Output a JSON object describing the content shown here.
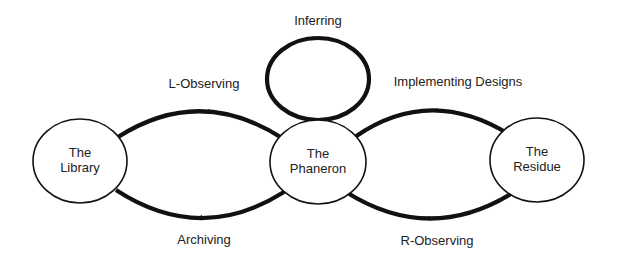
{
  "diagram": {
    "type": "state-cycle",
    "nodes": [
      {
        "id": "library",
        "line1": "The",
        "line2": "Library"
      },
      {
        "id": "phaneron",
        "line1": "The",
        "line2": "Phaneron"
      },
      {
        "id": "residue",
        "line1": "The",
        "line2": "Residue"
      }
    ],
    "edges": [
      {
        "id": "l-observing",
        "from": "library",
        "to": "phaneron",
        "label": "L-Observing"
      },
      {
        "id": "archiving",
        "from": "phaneron",
        "to": "library",
        "label": "Archiving"
      },
      {
        "id": "inferring",
        "from": "phaneron",
        "to": "phaneron",
        "label": "Inferring"
      },
      {
        "id": "implementing-designs",
        "from": "phaneron",
        "to": "residue",
        "label": "Implementing Designs"
      },
      {
        "id": "r-observing",
        "from": "residue",
        "to": "phaneron",
        "label": "R-Observing"
      }
    ],
    "colors": {
      "stroke": "#111111",
      "text": "#222222",
      "background": "#ffffff"
    }
  }
}
